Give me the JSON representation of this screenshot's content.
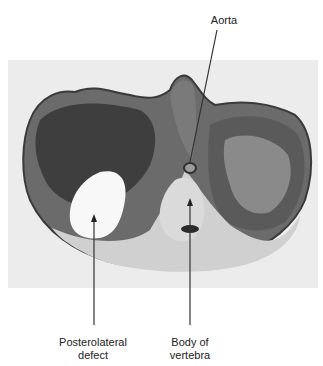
{
  "figure": {
    "labels": {
      "aorta": "Aorta",
      "posterolateral_defect": "Posterolateral defect",
      "posterolateral_defect_line1": "Posterolateral",
      "posterolateral_defect_line2": "defect",
      "body_of_vertebra_line1": "Body of",
      "body_of_vertebra_line2": "vertebra"
    },
    "colors": {
      "background": "#ffffff",
      "photo_background": "#ececec",
      "tissue_dark": "#3a3a3a",
      "tissue_mid": "#7a7a7a",
      "tissue_light": "#cfcfcf",
      "label_text": "#222222"
    }
  }
}
